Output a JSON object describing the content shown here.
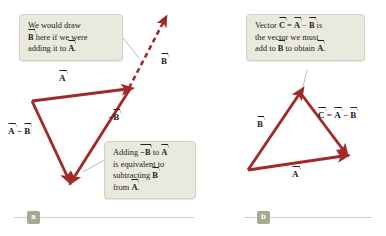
{
  "figure": {
    "background_color": "#ffffff",
    "vector_color": "#a02a2a",
    "callout_fill": "#e9e9de",
    "callout_border": "#d2d2c2",
    "badge_color": "#a9a992",
    "text_color": "#262220"
  },
  "panels": [
    {
      "id": "a",
      "badge": "a",
      "callouts": [
        {
          "id": "callout-a",
          "lines": [
            {
              "pre": "We would draw",
              "sym": "",
              "post": ""
            },
            {
              "pre": "",
              "sym": "B",
              "post": " here if we were"
            },
            {
              "pre": "adding it to ",
              "sym": "A",
              "post": "."
            }
          ]
        },
        {
          "id": "callout-b",
          "lines": [
            {
              "pre": "Adding ",
              "sym": "−B",
              "post": " to "
            },
            {
              "pre": "is equivalent to",
              "sym": "",
              "post": ""
            },
            {
              "pre": "subtracting ",
              "sym": "B",
              "post": ""
            },
            {
              "pre": "from ",
              "sym": "A",
              "post": "."
            }
          ]
        }
      ],
      "vector_labels": [
        {
          "name": "label-A",
          "text": "A",
          "prefix": "",
          "suffix": ""
        },
        {
          "name": "label-neg-B",
          "text": "−B",
          "prefix": "",
          "suffix": ""
        },
        {
          "name": "label-B-dashed",
          "text": "B",
          "prefix": "",
          "suffix": ""
        },
        {
          "name": "label-A-minus-B",
          "text": "A",
          "prefix": "",
          "suffix": "",
          "second": "B",
          "operator": " − "
        }
      ]
    },
    {
      "id": "b",
      "badge": "b",
      "callouts": [
        {
          "id": "callout-c",
          "lines": [
            {
              "pre": "Vector ",
              "sym": "C",
              "post": " = "
            },
            {
              "pre": "the vector we must",
              "sym": "",
              "post": ""
            },
            {
              "pre": "add to ",
              "sym": "B",
              "post": " to obtain "
            }
          ]
        }
      ],
      "vector_labels": [
        {
          "name": "label-B",
          "text": "B"
        },
        {
          "name": "label-A2",
          "text": "A"
        },
        {
          "name": "label-C-eq",
          "text": "C = A − B"
        }
      ]
    }
  ],
  "text": {
    "callout_a_l1": "We would draw",
    "callout_a_l2_b": "B",
    "callout_a_l2_rest": " here if we were",
    "callout_a_l3_pre": "adding it to ",
    "callout_a_l3_a": "A",
    "callout_a_l3_post": ".",
    "callout_b_l1_pre": "Adding ",
    "callout_b_l1_negb": "−B",
    "callout_b_l1_mid": " to ",
    "callout_b_l1_a": "A",
    "callout_b_l2": "is equivalent to",
    "callout_b_l3_pre": "subtracting ",
    "callout_b_l3_b": "B",
    "callout_b_l4_pre": "from ",
    "callout_b_l4_a": "A",
    "callout_b_l4_post": ".",
    "callout_c_l1_pre": "Vector ",
    "callout_c_l1_c": "C",
    "callout_c_l1_eq": " = ",
    "callout_c_l1_a": "A",
    "callout_c_l1_minus": " − ",
    "callout_c_l1_b": "B",
    "callout_c_l1_post": " is",
    "callout_c_l2": "the vector we must",
    "callout_c_l3_pre": "add to ",
    "callout_c_l3_b": "B",
    "callout_c_l3_mid": " to obtain ",
    "callout_c_l3_a": "A",
    "callout_c_l3_post": ".",
    "lbl_A": "A",
    "lbl_negB_minus": "−",
    "lbl_negB_B": "B",
    "lbl_B_dashed": "B",
    "lbl_AminusB_A": "A",
    "lbl_AminusB_op": " − ",
    "lbl_AminusB_B": "B",
    "lbl_B2": "B",
    "lbl_A2": "A",
    "lbl_C_c": "C",
    "lbl_C_eq": " = ",
    "lbl_C_a": "A",
    "lbl_C_minus": " − ",
    "lbl_C_b": "B",
    "badge_a": "a",
    "badge_b": "b"
  }
}
